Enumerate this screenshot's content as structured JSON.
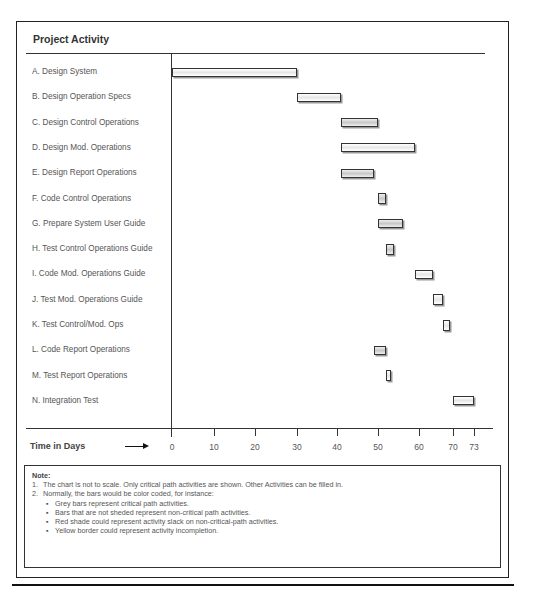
{
  "chart_data": {
    "type": "gantt",
    "title": "Project Activity",
    "xlabel": "Time in Days",
    "x_ticks": [
      0,
      10,
      20,
      30,
      40,
      50,
      60,
      70,
      73
    ],
    "xlim": [
      0,
      73
    ],
    "tasks": [
      {
        "label": "A.  Design System",
        "start": 0,
        "end": 30,
        "style": "white"
      },
      {
        "label": "B.  Design Operation Specs",
        "start": 30,
        "end": 41,
        "style": "white"
      },
      {
        "label": "C.  Design Control Operations",
        "start": 41,
        "end": 50,
        "style": "grey"
      },
      {
        "label": "D.  Design Mod. Operations",
        "start": 41,
        "end": 59,
        "style": "white"
      },
      {
        "label": "E.  Design Report Operations",
        "start": 41,
        "end": 49,
        "style": "grey"
      },
      {
        "label": "F.  Code Control Operations",
        "start": 50,
        "end": 52,
        "style": "grey"
      },
      {
        "label": "G.  Prepare System User Guide",
        "start": 50,
        "end": 56,
        "style": "grey"
      },
      {
        "label": "H.  Test Control Operations Guide",
        "start": 52,
        "end": 54,
        "style": "grey"
      },
      {
        "label": "I.  Code Mod. Operations Guide",
        "start": 59,
        "end": 64,
        "style": "white"
      },
      {
        "label": "J.  Test Mod. Operations Guide",
        "start": 64,
        "end": 67,
        "style": "white"
      },
      {
        "label": "K.  Test Control/Mod. Ops",
        "start": 67,
        "end": 69,
        "style": "white"
      },
      {
        "label": "L.  Code Report Operations",
        "start": 49,
        "end": 52,
        "style": "grey"
      },
      {
        "label": "M.  Test Report Operations",
        "start": 52,
        "end": 53,
        "style": "white"
      },
      {
        "label": "N.  Integration Test",
        "start": 70,
        "end": 73,
        "style": "white"
      }
    ]
  },
  "axis": {
    "title": "Time in Days",
    "ticks": [
      "0",
      "10",
      "20",
      "30",
      "40",
      "50",
      "60",
      "70",
      "73"
    ]
  },
  "notes": {
    "title": "Note:",
    "items": [
      {
        "num": "1.",
        "text": "The chart is not to scale. Only critical path activities are shown.  Other Activities can be filled in."
      },
      {
        "num": "2.",
        "text": "Normally, the bars would be color coded, for instance:"
      }
    ],
    "bullets": [
      "Grey bars represent critical path activities.",
      "Bars that are not sheded represent non-critical path activities.",
      "Red shade could represent activity slack on non-critical-path activities.",
      "Yellow border could represent activity incompletion."
    ]
  }
}
